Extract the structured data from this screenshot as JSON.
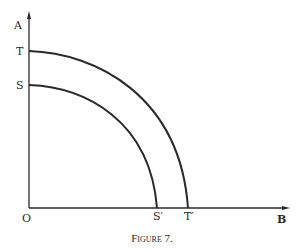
{
  "figure": {
    "caption": "Figure 7.",
    "labels": {
      "y_axis": "A",
      "x_axis": "B",
      "origin": "O",
      "outer_y_intercept": "T",
      "inner_y_intercept": "S",
      "inner_x_intercept": "S′",
      "outer_x_intercept": "T′"
    },
    "curves": [
      {
        "name": "inner curve",
        "from": "S",
        "to": "S′"
      },
      {
        "name": "outer curve",
        "from": "T",
        "to": "T′"
      }
    ],
    "colors": {
      "ink": "#2a2a2a",
      "background": "#ffffff"
    }
  }
}
